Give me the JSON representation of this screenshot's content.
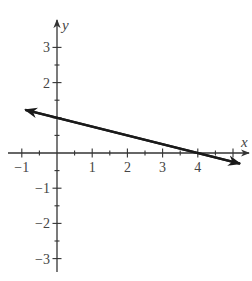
{
  "chart_data": {
    "type": "line",
    "title": "",
    "xlabel": "x",
    "ylabel": "y",
    "xlim": [
      -1.3,
      5.5
    ],
    "ylim": [
      -3.3,
      3.6
    ],
    "grid": false,
    "legend": null,
    "x_ticks": [
      -1,
      1,
      2,
      3,
      4
    ],
    "x_tick_labels": [
      "−1",
      "1",
      "2",
      "3",
      "4"
    ],
    "y_ticks": [
      3,
      2,
      -1,
      -2,
      -3
    ],
    "y_tick_labels": [
      "3",
      "2",
      "−1",
      "−2",
      "−3"
    ],
    "minor_tick_step": 0.5,
    "series": [
      {
        "name": "line",
        "equation": "y = -x/4 + 1",
        "slope": -0.25,
        "intercept": 1,
        "x_intercept": 4,
        "x": [
          -0.9,
          0,
          4,
          5.2
        ],
        "y": [
          1.225,
          1,
          0,
          -0.3
        ],
        "arrows": "both",
        "color": "#1a1a1a"
      }
    ]
  },
  "axis_color": "#333333"
}
